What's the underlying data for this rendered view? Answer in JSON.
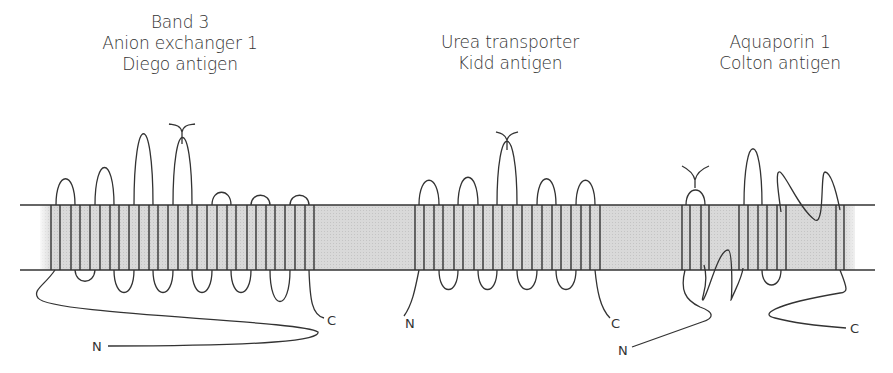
{
  "figure": {
    "proteins": [
      {
        "id": "band3",
        "lines": [
          "Band 3",
          "Anion exchanger 1",
          "Diego antigen"
        ]
      },
      {
        "id": "urea",
        "lines": [
          "Urea transporter",
          "Kidd antigen"
        ]
      },
      {
        "id": "aqp1",
        "lines": [
          "Aquaporin 1",
          "Colton antigen"
        ]
      }
    ],
    "termini": {
      "n": "N",
      "c": "C"
    },
    "colors": {
      "membrane": "#d6d6d6",
      "line": "#333333"
    }
  }
}
